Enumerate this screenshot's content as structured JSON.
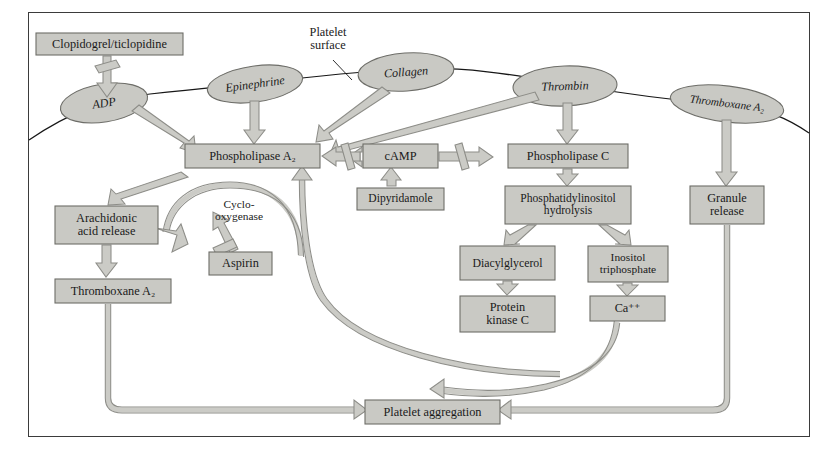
{
  "diagram": {
    "colors": {
      "box_fill": "#c9c9c4",
      "box_stroke": "#6d6d68",
      "ellipse_fill": "#c9c9c4",
      "ellipse_stroke": "#6d6d68",
      "arrow_fill": "#cbcbc6",
      "arrow_stroke": "#8d8d88",
      "frame_stroke": "#3b3b3b",
      "membrane_stroke": "#1a1a1a",
      "background": "#ffffff",
      "text": "#1a1a1a"
    },
    "annotations": [
      {
        "name": "platelet-surface-label",
        "text": "Platelet\nsurface",
        "x": 290,
        "y": 24,
        "w": 76,
        "h": 30
      },
      {
        "name": "cyclooxygenase-label",
        "text": "Cyclo-\noxygenase",
        "x": 196,
        "y": 196,
        "w": 86,
        "h": 30
      }
    ],
    "receptors": [
      {
        "name": "adp",
        "label": "ADP",
        "cx": 104,
        "cy": 103,
        "rx": 44,
        "ry": 19,
        "rot": -9
      },
      {
        "name": "epinephrine",
        "label": "Epinephrine",
        "cx": 255,
        "cy": 84,
        "rx": 48,
        "ry": 18,
        "rot": -8
      },
      {
        "name": "collagen",
        "label": "Collagen",
        "cx": 406,
        "cy": 72,
        "rx": 48,
        "ry": 19,
        "rot": -4
      },
      {
        "name": "thrombin",
        "label": "Thrombin",
        "cx": 565,
        "cy": 86,
        "rx": 52,
        "ry": 20,
        "rot": -2
      },
      {
        "name": "thromboxane-a2-receptor",
        "label": "Thromboxane A₂",
        "cx": 727,
        "cy": 104,
        "rx": 57,
        "ry": 18,
        "rot": 7
      }
    ],
    "boxes": [
      {
        "name": "clopidogrel-ticlopidine",
        "label": "Clopidogrel/ticlopidine",
        "x": 36,
        "y": 33,
        "w": 147,
        "h": 22
      },
      {
        "name": "phospholipase-a2",
        "label": "Phospholipase A₂",
        "x": 185,
        "y": 144,
        "w": 135,
        "h": 24
      },
      {
        "name": "camp",
        "label": "cAMP",
        "x": 363,
        "y": 144,
        "w": 75,
        "h": 24
      },
      {
        "name": "phospholipase-c",
        "label": "Phospholipase C",
        "x": 508,
        "y": 144,
        "w": 120,
        "h": 24
      },
      {
        "name": "dipyridamole",
        "label": "Dipyridamole",
        "x": 357,
        "y": 188,
        "w": 87,
        "h": 22
      },
      {
        "name": "arachidonic-acid-release",
        "label": "Arachidonic\nacid release",
        "x": 55,
        "y": 206,
        "w": 103,
        "h": 38
      },
      {
        "name": "aspirin",
        "label": "Aspirin",
        "x": 209,
        "y": 252,
        "w": 63,
        "h": 23
      },
      {
        "name": "thromboxane-a2-product",
        "label": "Thromboxane A₂",
        "x": 55,
        "y": 279,
        "w": 116,
        "h": 24
      },
      {
        "name": "phosphatidylinositol-hydrolysis",
        "label": "Phosphatidylinositol\nhydrolysis",
        "x": 505,
        "y": 186,
        "w": 126,
        "h": 38
      },
      {
        "name": "granule-release",
        "label": "Granule\nrelease",
        "x": 690,
        "y": 186,
        "w": 74,
        "h": 38
      },
      {
        "name": "diacylglycerol",
        "label": "Diacylglycerol",
        "x": 460,
        "y": 246,
        "w": 95,
        "h": 34
      },
      {
        "name": "inositol-triphosphate",
        "label": "Inositol\ntriphosphate",
        "x": 588,
        "y": 246,
        "w": 80,
        "h": 36
      },
      {
        "name": "protein-kinase-c",
        "label": "Protein\nkinase C",
        "x": 460,
        "y": 296,
        "w": 95,
        "h": 36
      },
      {
        "name": "calcium-ion",
        "label": "Ca⁺⁺",
        "x": 590,
        "y": 296,
        "w": 75,
        "h": 25
      },
      {
        "name": "platelet-aggregation",
        "label": "Platelet aggregation",
        "x": 365,
        "y": 400,
        "w": 135,
        "h": 24
      }
    ],
    "edges": [
      {
        "name": "clopidogrel-inhibits-adp",
        "from": "clopidogrel-ticlopidine",
        "to": "adp",
        "kind": "inhibition"
      },
      {
        "name": "adp-activates-pla2",
        "from": "adp",
        "to": "phospholipase-a2",
        "kind": "activation"
      },
      {
        "name": "epinephrine-activates-pla2",
        "from": "epinephrine",
        "to": "phospholipase-a2",
        "kind": "activation"
      },
      {
        "name": "collagen-activates-pla2",
        "from": "collagen",
        "to": "phospholipase-a2",
        "kind": "activation"
      },
      {
        "name": "thrombin-activates-pla2",
        "from": "thrombin",
        "to": "phospholipase-a2",
        "kind": "activation"
      },
      {
        "name": "thrombin-activates-plc",
        "from": "thrombin",
        "to": "phospholipase-c",
        "kind": "activation"
      },
      {
        "name": "camp-inhibits-pla2",
        "from": "camp",
        "to": "phospholipase-a2",
        "kind": "inhibition"
      },
      {
        "name": "camp-inhibits-plc",
        "from": "camp",
        "to": "phospholipase-c",
        "kind": "inhibition"
      },
      {
        "name": "dipyridamole-raises-camp",
        "from": "dipyridamole",
        "to": "camp",
        "kind": "activation"
      },
      {
        "name": "pla2-to-arachidonic-acid",
        "from": "phospholipase-a2",
        "to": "arachidonic-acid-release",
        "kind": "activation"
      },
      {
        "name": "arachidonic-acid-to-txa2",
        "from": "arachidonic-acid-release",
        "to": "thromboxane-a2-product",
        "kind": "activation"
      },
      {
        "name": "aspirin-inhibits-cyclooxygenase",
        "from": "aspirin",
        "to": "cyclooxygenase-label",
        "kind": "inhibition"
      },
      {
        "name": "txa2-to-aggregation",
        "from": "thromboxane-a2-product",
        "to": "platelet-aggregation",
        "kind": "activation"
      },
      {
        "name": "thromboxane-receptor-to-granule",
        "from": "thromboxane-a2-receptor",
        "to": "granule-release",
        "kind": "activation"
      },
      {
        "name": "granule-to-aggregation",
        "from": "granule-release",
        "to": "platelet-aggregation",
        "kind": "activation"
      },
      {
        "name": "plc-to-pi-hydrolysis",
        "from": "phospholipase-c",
        "to": "phosphatidylinositol-hydrolysis",
        "kind": "activation"
      },
      {
        "name": "pi-to-diacylglycerol",
        "from": "phosphatidylinositol-hydrolysis",
        "to": "diacylglycerol",
        "kind": "activation"
      },
      {
        "name": "pi-to-inositol-triphosphate",
        "from": "phosphatidylinositol-hydrolysis",
        "to": "inositol-triphosphate",
        "kind": "activation"
      },
      {
        "name": "dag-to-protein-kinase-c",
        "from": "diacylglycerol",
        "to": "protein-kinase-c",
        "kind": "activation"
      },
      {
        "name": "ip3-to-calcium",
        "from": "inositol-triphosphate",
        "to": "calcium-ion",
        "kind": "activation"
      },
      {
        "name": "calcium-to-aggregation",
        "from": "calcium-ion",
        "to": "platelet-aggregation",
        "kind": "activation"
      },
      {
        "name": "calcium-feedback-to-pla2",
        "from": "calcium-ion",
        "to": "phospholipase-a2",
        "kind": "activation"
      }
    ]
  }
}
